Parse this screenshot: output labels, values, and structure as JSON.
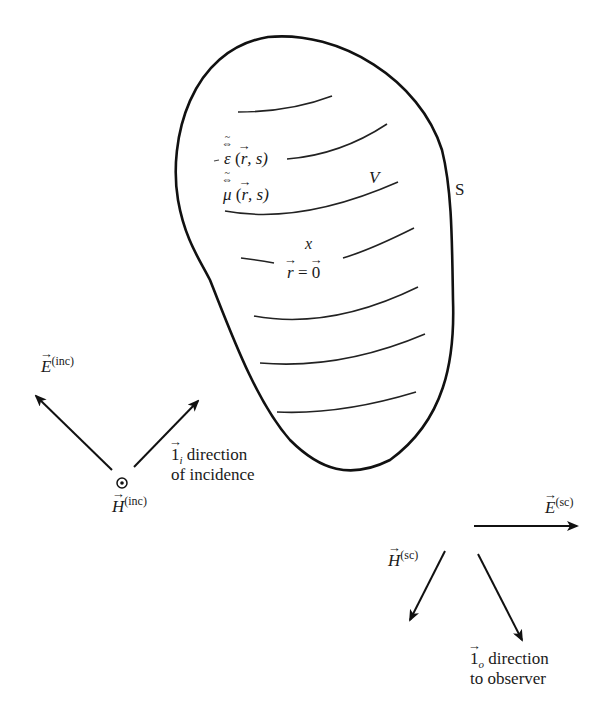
{
  "figure": {
    "surface_label": "S",
    "volume_label": "V",
    "permittivity": {
      "symbol": "ε",
      "args": "(r, s)",
      "arg_r": "r",
      "arg_s": ", s)",
      "open": "("
    },
    "permeability": {
      "symbol": "μ",
      "args": "(r, s)",
      "arg_r": "r",
      "arg_s": ", s)",
      "open": "("
    },
    "origin_marker": "x",
    "origin_label": {
      "lhs": "r",
      "eq": " = ",
      "rhs": "0"
    },
    "incident": {
      "E_symbol": "E",
      "E_superscript": "(inc)",
      "H_symbol": "H",
      "H_superscript": "(inc)",
      "direction_symbol": "1",
      "direction_subscript": "i",
      "direction_line1": " direction",
      "direction_line2": "of incidence",
      "H_marker": "out-of-page-dot-icon"
    },
    "scattered": {
      "E_symbol": "E",
      "E_superscript": "(sc)",
      "H_symbol": "H",
      "H_superscript": "(sc)",
      "direction_symbol": "1",
      "direction_subscript": "o",
      "direction_line1": " direction",
      "direction_line2": "to observer"
    },
    "colors": {
      "stroke": "#111111",
      "background": "#ffffff"
    }
  }
}
